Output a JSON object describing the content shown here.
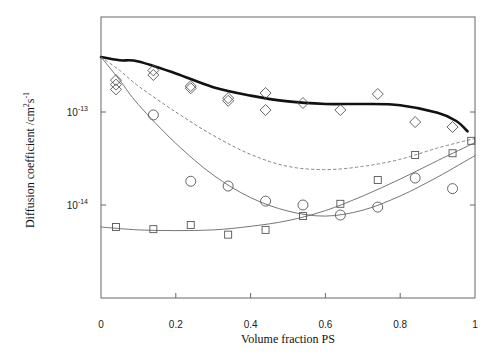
{
  "chart_data": {
    "type": "scatter",
    "title": "",
    "xlabel": "Volume fraction PS",
    "ylabel": "Diffusion coefficient /cm²s⁻¹",
    "ylabel_parts": {
      "main": "Diffusion coefficient /cm",
      "sup1": "2",
      "mid": "s",
      "sup2": "-1"
    },
    "xscale": "linear",
    "yscale": "log",
    "xlim": [
      0,
      1
    ],
    "ylim": [
      1.3e-15,
      6.5e-13
    ],
    "grid": false,
    "legend": null,
    "x_ticks": [
      {
        "value": 0,
        "label": "0"
      },
      {
        "value": 0.2,
        "label": "0.2"
      },
      {
        "value": 0.4,
        "label": "0.4"
      },
      {
        "value": 0.6,
        "label": "0.6"
      },
      {
        "value": 0.8,
        "label": "0.8"
      },
      {
        "value": 1,
        "label": "1"
      }
    ],
    "y_ticks": [
      {
        "value": 1e-13,
        "base": "10",
        "exp": "-13"
      },
      {
        "value": 1e-14,
        "base": "10",
        "exp": "-14"
      }
    ],
    "series": [
      {
        "name": "diamonds",
        "marker": "diamond",
        "x": [
          0.04,
          0.04,
          0.04,
          0.14,
          0.14,
          0.24,
          0.24,
          0.34,
          0.34,
          0.44,
          0.44,
          0.54,
          0.64,
          0.74,
          0.84,
          0.94
        ],
        "y": [
          2.2e-13,
          1.97e-13,
          1.75e-13,
          2.8e-13,
          2.5e-13,
          1.9e-13,
          1.8e-13,
          1.41e-13,
          1.32e-13,
          1.6e-13,
          1.05e-13,
          1.25e-13,
          1.05e-13,
          1.56e-13,
          7.8e-14,
          6.9e-14
        ]
      },
      {
        "name": "circles",
        "marker": "circle",
        "x": [
          0.14,
          0.24,
          0.34,
          0.44,
          0.54,
          0.64,
          0.74,
          0.84,
          0.94
        ],
        "y": [
          9.3e-14,
          1.8e-14,
          1.6e-14,
          1.1e-14,
          1e-14,
          7.8e-15,
          9.5e-15,
          1.95e-14,
          1.5e-14
        ]
      },
      {
        "name": "squares",
        "marker": "square",
        "x": [
          0.04,
          0.14,
          0.24,
          0.34,
          0.44,
          0.54,
          0.64,
          0.74,
          0.84,
          0.94,
          0.99
        ],
        "y": [
          5.8e-15,
          5.5e-15,
          6.1e-15,
          4.8e-15,
          5.4e-15,
          7.6e-15,
          1.03e-14,
          1.86e-14,
          3.45e-14,
          3.6e-14,
          4.9e-14
        ]
      }
    ],
    "curves": [
      {
        "name": "thick-fit",
        "style": "solid-thick",
        "x": [
          0.0,
          0.05,
          0.1,
          0.2,
          0.3,
          0.4,
          0.5,
          0.6,
          0.7,
          0.8,
          0.9,
          0.95,
          0.98
        ],
        "y": [
          3.9e-13,
          3.6e-13,
          3.5e-13,
          2.6e-13,
          1.85e-13,
          1.5e-13,
          1.3e-13,
          1.22e-13,
          1.22e-13,
          1.18e-13,
          9.8e-14,
          8e-14,
          6.2e-14
        ]
      },
      {
        "name": "dashed-fit",
        "style": "dashed",
        "x": [
          0.0,
          0.05,
          0.1,
          0.2,
          0.3,
          0.4,
          0.5,
          0.6,
          0.7,
          0.8,
          0.9,
          1.0
        ],
        "y": [
          3.9e-13,
          2.8e-13,
          1.9e-13,
          1e-13,
          5.6e-14,
          3.5e-14,
          2.6e-14,
          2.4e-14,
          2.6e-14,
          3.1e-14,
          4.1e-14,
          5.2e-14
        ]
      },
      {
        "name": "thin-fit-circles",
        "style": "solid-thin",
        "x": [
          0.0,
          0.05,
          0.1,
          0.2,
          0.3,
          0.4,
          0.5,
          0.6,
          0.7,
          0.8,
          0.9,
          1.0
        ],
        "y": [
          3.9e-13,
          2.2e-13,
          1.2e-13,
          4.6e-14,
          2.1e-14,
          1.2e-14,
          8.6e-15,
          7.6e-15,
          8.8e-15,
          1.25e-14,
          2e-14,
          3.4e-14
        ]
      },
      {
        "name": "thin-fit-squares",
        "style": "solid-thin",
        "x": [
          0.0,
          0.1,
          0.2,
          0.3,
          0.4,
          0.5,
          0.6,
          0.7,
          0.8,
          0.9,
          1.0
        ],
        "y": [
          5.8e-15,
          5.4e-15,
          5.3e-15,
          5.4e-15,
          5.9e-15,
          6.8e-15,
          8.7e-15,
          1.25e-14,
          1.9e-14,
          3e-14,
          4.7e-14
        ]
      }
    ],
    "colors": {
      "axis": "#555555",
      "markers": "#555555",
      "thick_line": "#111111",
      "thin_line": "#666666",
      "dashed_line": "#777777"
    }
  }
}
